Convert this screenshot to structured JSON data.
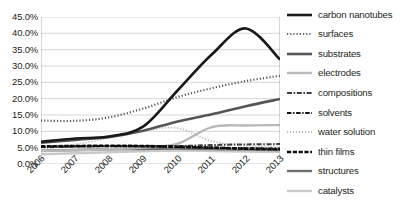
{
  "chart_data": {
    "type": "line",
    "title": "",
    "xlabel": "",
    "ylabel": "",
    "x": [
      "2006",
      "2007",
      "2008",
      "2009",
      "2010",
      "2011",
      "2012",
      "2013"
    ],
    "categories": [
      "2006",
      "2007",
      "2008",
      "2009",
      "2010",
      "2011",
      "2012",
      "2013"
    ],
    "ylim": [
      0,
      45
    ],
    "yticks": [
      "0.0%",
      "5.0%",
      "10.0%",
      "15.0%",
      "20.0%",
      "25.0%",
      "30.0%",
      "35.0%",
      "40.0%",
      "45.0%"
    ],
    "ytick_values": [
      0,
      5,
      10,
      15,
      20,
      25,
      30,
      35,
      40,
      45
    ],
    "grid": true,
    "legend_position": "right",
    "series": [
      {
        "name": "carbon nanotubes",
        "values": [
          6.8,
          7.8,
          8.4,
          11.5,
          22.5,
          33.5,
          41.5,
          32.0
        ],
        "color": "#1a1a1a",
        "width": 2.6,
        "dash": "none"
      },
      {
        "name": "surfaces",
        "values": [
          13.3,
          13.2,
          14.3,
          17.0,
          20.5,
          23.2,
          25.4,
          27.0
        ],
        "color": "#5a5a5a",
        "width": 2.2,
        "dash": "1.2,2.0"
      },
      {
        "name": "substrates",
        "values": [
          6.5,
          7.4,
          8.3,
          10.2,
          13.0,
          15.2,
          17.7,
          19.9
        ],
        "color": "#565656",
        "width": 2.6,
        "dash": "none"
      },
      {
        "name": "electrodes",
        "values": [
          4.0,
          4.2,
          4.5,
          5.0,
          6.2,
          11.3,
          11.8,
          11.9
        ],
        "color": "#b8b8b8",
        "width": 2.4,
        "dash": "none"
      },
      {
        "name": "compositions",
        "values": [
          5.3,
          5.4,
          5.5,
          5.5,
          5.5,
          5.8,
          6.0,
          6.1
        ],
        "color": "#3d3d3d",
        "width": 2.0,
        "dash": "5,1.6,1.6,1.6"
      },
      {
        "name": "solvents",
        "values": [
          5.2,
          5.4,
          5.5,
          5.4,
          5.2,
          5.0,
          4.8,
          4.7
        ],
        "color": "#141414",
        "width": 2.2,
        "dash": "4.5,1.6,1.4,1.6"
      },
      {
        "name": "water solution",
        "values": [
          4.6,
          6.0,
          8.0,
          10.2,
          11.0,
          7.0,
          5.6,
          5.3
        ],
        "color": "#bdbdbd",
        "width": 2.0,
        "dash": "1.2,1.8"
      },
      {
        "name": "thin films",
        "values": [
          5.4,
          5.5,
          5.6,
          5.5,
          5.3,
          5.0,
          4.7,
          4.5
        ],
        "color": "#0d0d0d",
        "width": 2.6,
        "dash": "4.2,1.6"
      },
      {
        "name": "structures",
        "values": [
          4.1,
          4.3,
          4.5,
          4.6,
          4.7,
          4.6,
          4.4,
          4.3
        ],
        "color": "#6e6e6e",
        "width": 2.4,
        "dash": "none"
      },
      {
        "name": "catalysts",
        "values": [
          3.0,
          3.3,
          3.6,
          3.9,
          4.1,
          4.0,
          3.8,
          3.7
        ],
        "color": "#c9c9c9",
        "width": 2.4,
        "dash": "none"
      }
    ]
  },
  "axis": {
    "y_labels": [
      "45.0%",
      "40.0%",
      "35.0%",
      "30.0%",
      "25.0%",
      "20.0%",
      "15.0%",
      "10.0%",
      "5.0%",
      "0.0%"
    ],
    "x_labels": [
      "2006",
      "2007",
      "2008",
      "2009",
      "2010",
      "2011",
      "2012",
      "2013"
    ]
  },
  "legend": {
    "items": [
      {
        "label": "carbon nanotubes"
      },
      {
        "label": "surfaces"
      },
      {
        "label": "substrates"
      },
      {
        "label": "electrodes"
      },
      {
        "label": "compositions"
      },
      {
        "label": "solvents"
      },
      {
        "label": "water solution"
      },
      {
        "label": "thin films"
      },
      {
        "label": "structures"
      },
      {
        "label": "catalysts"
      }
    ]
  },
  "colors": {
    "background": "#ffffff",
    "grid": "#c6c6c6",
    "axis": "#9a9a9a",
    "text": "#231f20"
  }
}
